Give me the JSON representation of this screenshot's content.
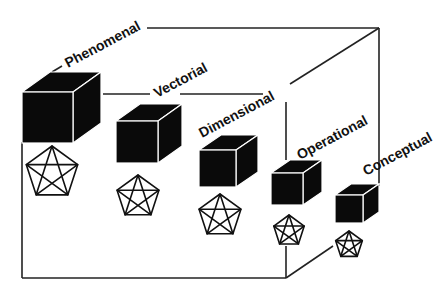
{
  "diagram": {
    "type": "nested-cube-hierarchy",
    "colors": {
      "cube": "#0a0a0a",
      "line": "#222222",
      "background": "#ffffff",
      "text": "#111111"
    },
    "levels": [
      {
        "label": "Phenomenal",
        "cube": {
          "x": 22,
          "y": 92,
          "size": 51,
          "dx": 28,
          "dy": 20
        },
        "pentagon": {
          "cx": 52,
          "cy": 173,
          "r": 27
        },
        "label_pos": {
          "x": 68,
          "y": 68,
          "angle": -28
        }
      },
      {
        "label": "Vectorial",
        "cube": {
          "x": 116,
          "y": 121,
          "size": 42,
          "dx": 24,
          "dy": 17
        },
        "pentagon": {
          "cx": 138,
          "cy": 197,
          "r": 22
        },
        "label_pos": {
          "x": 157,
          "y": 98,
          "angle": -28
        }
      },
      {
        "label": "Dimensional",
        "cube": {
          "x": 199,
          "y": 150,
          "size": 37,
          "dx": 22,
          "dy": 15
        },
        "pentagon": {
          "cx": 220,
          "cy": 216,
          "r": 22
        },
        "label_pos": {
          "x": 202,
          "y": 138,
          "angle": -28
        }
      },
      {
        "label": "Operational",
        "cube": {
          "x": 271,
          "y": 173,
          "size": 32,
          "dx": 19,
          "dy": 13
        },
        "pentagon": {
          "cx": 289,
          "cy": 231,
          "r": 16
        },
        "label_pos": {
          "x": 300,
          "y": 160,
          "angle": -28
        }
      },
      {
        "label": "Conceptual",
        "cube": {
          "x": 335,
          "y": 195,
          "size": 28,
          "dx": 16,
          "dy": 11
        },
        "pentagon": {
          "cx": 349,
          "cy": 245,
          "r": 14
        },
        "label_pos": {
          "x": 366,
          "y": 176,
          "angle": -28
        }
      }
    ]
  }
}
